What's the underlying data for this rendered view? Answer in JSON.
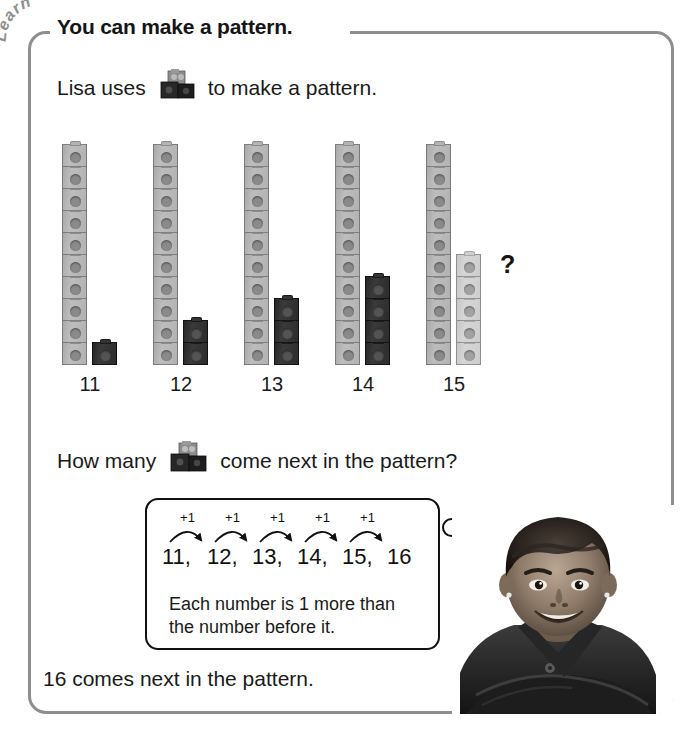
{
  "tab": {
    "label": "Learn"
  },
  "header": {
    "title": "You can make a pattern."
  },
  "intro": {
    "text_before": "Lisa uses",
    "icon": "snap-cubes-icon",
    "text_after": "to make a pattern."
  },
  "pattern": {
    "question_mark": "?",
    "towers": [
      {
        "label": "11",
        "tens_cubes": 10,
        "ones_cubes": 1,
        "tens_color": "#b2b2b2",
        "ones_color": "#2c2c2c"
      },
      {
        "label": "12",
        "tens_cubes": 10,
        "ones_cubes": 2,
        "tens_color": "#b2b2b2",
        "ones_color": "#2c2c2c"
      },
      {
        "label": "13",
        "tens_cubes": 10,
        "ones_cubes": 3,
        "tens_color": "#b2b2b2",
        "ones_color": "#2c2c2c"
      },
      {
        "label": "14",
        "tens_cubes": 10,
        "ones_cubes": 4,
        "tens_color": "#b2b2b2",
        "ones_color": "#2c2c2c"
      },
      {
        "label": "15",
        "tens_cubes": 10,
        "ones_cubes": 5,
        "tens_color": "#b2b2b2",
        "ones_color": "#cdcdcd"
      }
    ]
  },
  "howmany": {
    "text_before": "How many",
    "icon": "snap-cubes-icon",
    "text_after": "come next in the pattern?"
  },
  "answer_box": {
    "sequence": [
      "11,",
      "12,",
      "13,",
      "14,",
      "15,",
      "16"
    ],
    "step_labels": [
      "+1",
      "+1",
      "+1",
      "+1",
      "+1"
    ],
    "explanation_line1": "Each number is 1 more than",
    "explanation_line2": "the number before it."
  },
  "closing": {
    "text": "16 comes next in the pattern."
  },
  "colors": {
    "frame_border": "#8e8e8e",
    "text": "#1a1a1a",
    "box_border": "#111111",
    "cube_gray": "#b2b2b2",
    "cube_light": "#cdcdcd",
    "cube_dark": "#2c2c2c"
  }
}
